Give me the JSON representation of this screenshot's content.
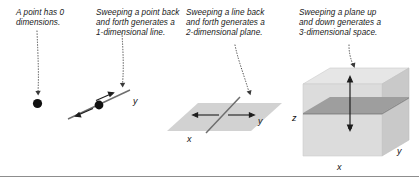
{
  "figure": {
    "panels": [
      {
        "id": "point",
        "caption": "A point has 0\ndimensions.",
        "dimension": 0,
        "shape": "point",
        "axis_labels": []
      },
      {
        "id": "line",
        "caption": "Sweeping a point back\nand forth generates a\n1-dimensional line.",
        "dimension": 1,
        "shape": "line",
        "axis_labels": [
          "y"
        ]
      },
      {
        "id": "plane",
        "caption": "Sweeping a line back\nand forth generates a\n2-dimensional plane.",
        "dimension": 2,
        "shape": "plane",
        "axis_labels": [
          "x",
          "y"
        ]
      },
      {
        "id": "space",
        "caption": "Sweeping a plane up\nand down generates a\n3-dimensional space.",
        "dimension": 3,
        "shape": "cube",
        "axis_labels": [
          "x",
          "y",
          "z"
        ]
      }
    ],
    "labels": {
      "line_y": "y",
      "plane_x": "x",
      "plane_y": "y",
      "cube_x": "x",
      "cube_y": "y",
      "cube_z": "z"
    },
    "colors": {
      "background": "#ffffff",
      "text": "#1a1a1a",
      "stroke": "#4d4d4d",
      "dot": "#111111",
      "plane_fill": "#d2d2d2",
      "cube_front": "#dcdcdc",
      "cube_top": "#e6e6e6",
      "cube_side": "#c9c9c9",
      "inner_plane": "#9e9e9e",
      "baseline": "#8d8d8d"
    }
  }
}
